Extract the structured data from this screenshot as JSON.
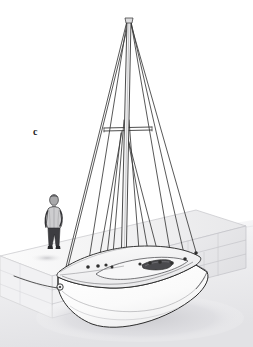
{
  "figure": {
    "domain": "Diagram",
    "kind": "technical-line-illustration",
    "panel_label": "c",
    "background_color": "#ffffff",
    "ink_color": "#2b2b2b",
    "line_color": "#3a3a3a",
    "hull_fill": "#fdfdfd",
    "deck_fill": "#f2f2f2",
    "shadow_color": "#d8d8da",
    "wall_fill": "#ececee",
    "wall_line": "#b9b9bd",
    "ground_fill": "#e6e6e8",
    "cockpit_fill": "#4a4a4e",
    "person_shirt": "#c9c9cb",
    "person_trousers": "#3d3d41",
    "person_head": "#9a9a9c"
  },
  "scene": {
    "mast": {
      "label": "mast",
      "head_x": 128,
      "head_y": 20,
      "foot_x": 120,
      "foot_y": 268
    },
    "spreaders": {
      "label": "spreaders",
      "y": 130,
      "left_x": 105,
      "right_x": 152
    },
    "rigging": [
      {
        "name": "forestay",
        "from": "masthead",
        "to": "bow-fitting"
      },
      {
        "name": "backstay",
        "from": "masthead",
        "to": "stern-quarter"
      },
      {
        "name": "port-upper-shroud",
        "from": "masthead",
        "to": "port-chainplate"
      },
      {
        "name": "starboard-upper-shroud",
        "from": "masthead",
        "to": "starboard-chainplate"
      },
      {
        "name": "port-lower-shroud",
        "from": "spreader",
        "to": "port-chainplate"
      },
      {
        "name": "starboard-lower-shroud",
        "from": "spreader",
        "to": "starboard-chainplate"
      },
      {
        "name": "temporary-side-stay",
        "from": "masthead",
        "to": "deck-forward"
      }
    ],
    "hull": {
      "label": "hull",
      "bow_x": 58,
      "bow_y": 286,
      "stern_x": 207,
      "stern_y": 272,
      "keel_low_x": 92,
      "keel_low_y": 325
    },
    "cockpit": {
      "label": "companionway-hatch"
    },
    "person": {
      "label": "person-for-scale",
      "x": 54,
      "y": 196,
      "height": 58
    },
    "quay_wall": {
      "label": "stone-quay-wall",
      "course_count": 3,
      "block_count": 7
    },
    "ground": {
      "label": "hardstanding-ground-plane"
    },
    "shadow": {
      "label": "cast-shadow"
    }
  }
}
